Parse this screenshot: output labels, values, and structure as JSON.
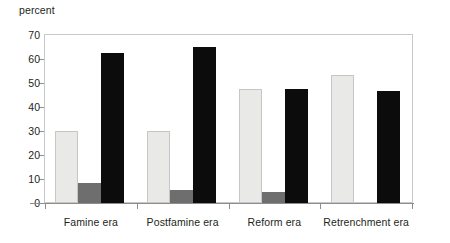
{
  "chart_data": {
    "type": "bar",
    "title": "",
    "subtitle": "",
    "xlabel": "",
    "ylabel": "percent",
    "categories": [
      "Famine era",
      "Postfamine era",
      "Reform era",
      "Retrenchment era"
    ],
    "series": [
      {
        "name": "series-1",
        "color": "#e9e9e7",
        "values": [
          30,
          30,
          47.5,
          53.5
        ]
      },
      {
        "name": "series-2",
        "color": "#6e6e6e",
        "values": [
          8.5,
          5.5,
          4.5,
          0
        ]
      },
      {
        "name": "series-3",
        "color": "#0c0c0c",
        "values": [
          62.5,
          65,
          47.5,
          46.5
        ]
      }
    ],
    "ylim": [
      0,
      70
    ],
    "yticks": [
      0,
      10,
      20,
      30,
      40,
      50,
      60,
      70
    ],
    "ytick_labels": [
      "0",
      "10",
      "20",
      "30",
      "40",
      "50",
      "60",
      "70"
    ],
    "grid": false,
    "legend": null,
    "legend_position": "none",
    "plot_border": true,
    "annotations": []
  },
  "colors": {
    "background": "#ffffff",
    "text": "#231f20",
    "axis": "#8d8d8d",
    "frame": "#c9c9c9",
    "series_light": "#e9e9e7",
    "series_light_edge": "#c6c6c4",
    "series_gray": "#6e6e6e",
    "series_black": "#0c0c0c"
  }
}
